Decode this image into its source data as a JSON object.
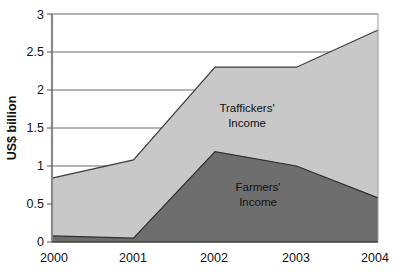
{
  "chart_data": {
    "type": "area",
    "stacked": true,
    "title": "",
    "subtitle": "",
    "xlabel": "",
    "ylabel": "US$ billion",
    "categories": [
      "2000",
      "2001",
      "2002",
      "2003",
      "2004"
    ],
    "x": [
      2000,
      2001,
      2002,
      2003,
      2004
    ],
    "xlim": [
      2000,
      2004
    ],
    "ylim": [
      0,
      3
    ],
    "yticks": [
      "0",
      "0.5",
      "1",
      "1.5",
      "2",
      "2.5",
      "3"
    ],
    "ytick_values": [
      0,
      0.5,
      1,
      1.5,
      2,
      2.5,
      3
    ],
    "xticks": [
      "2000",
      "2001",
      "2002",
      "2003",
      "2004"
    ],
    "grid": "horizontal",
    "legend": "inline-annotations",
    "series": [
      {
        "name": "Farmers' Income",
        "values": [
          0.08,
          0.05,
          1.19,
          1.0,
          0.58
        ],
        "color": "#6e6e6e"
      },
      {
        "name": "Traffickers' Income",
        "values": [
          0.76,
          1.03,
          1.11,
          1.3,
          2.21
        ],
        "color": "#c8c8c8"
      }
    ],
    "totals": [
      0.84,
      1.08,
      2.3,
      2.3,
      2.79
    ],
    "annotations": [
      {
        "text_line1": "Traffickers'",
        "text_line2": "Income",
        "x": 2002.55,
        "y": 1.72
      },
      {
        "text_line1": "Farmers'",
        "text_line2": "Income",
        "x": 2002.8,
        "y": 0.73
      }
    ]
  },
  "axis": {
    "y_title": "US$ billion",
    "y_tick_0": "0",
    "y_tick_1": "0.5",
    "y_tick_2": "1",
    "y_tick_3": "1.5",
    "y_tick_4": "2",
    "y_tick_5": "2.5",
    "y_tick_6": "3",
    "x_tick_0": "2000",
    "x_tick_1": "2001",
    "x_tick_2": "2002",
    "x_tick_3": "2003",
    "x_tick_4": "2004"
  },
  "labels": {
    "traffickers_line1": "Traffickers'",
    "traffickers_line2": "Income",
    "farmers_line1": "Farmers'",
    "farmers_line2": "Income"
  },
  "colors": {
    "traffickers_fill": "#c8c8c8",
    "farmers_fill": "#6e6e6e",
    "axis": "#808080",
    "gridline": "#6a6a6a",
    "outline": "#3c3c3c",
    "background": "#ffffff"
  }
}
